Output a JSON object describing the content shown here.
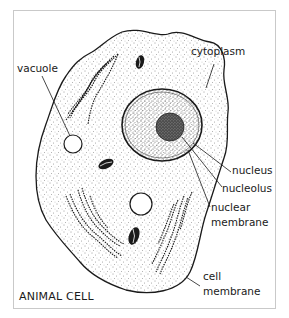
{
  "diagram": {
    "title": "ANIMAL CELL",
    "labels": {
      "cytoplasm": "cytoplasm",
      "vacuole": "vacuole",
      "nucleus": "nucleus",
      "nucleolus": "nucleolus",
      "nuclear_membrane_1": "nuclear",
      "nuclear_membrane_2": "membrane",
      "cell_membrane_1": "cell",
      "cell_membrane_2": "membrane"
    },
    "colors": {
      "ink": "#1a1a1a",
      "background": "#ffffff",
      "frame": "#c9c9c9"
    }
  }
}
